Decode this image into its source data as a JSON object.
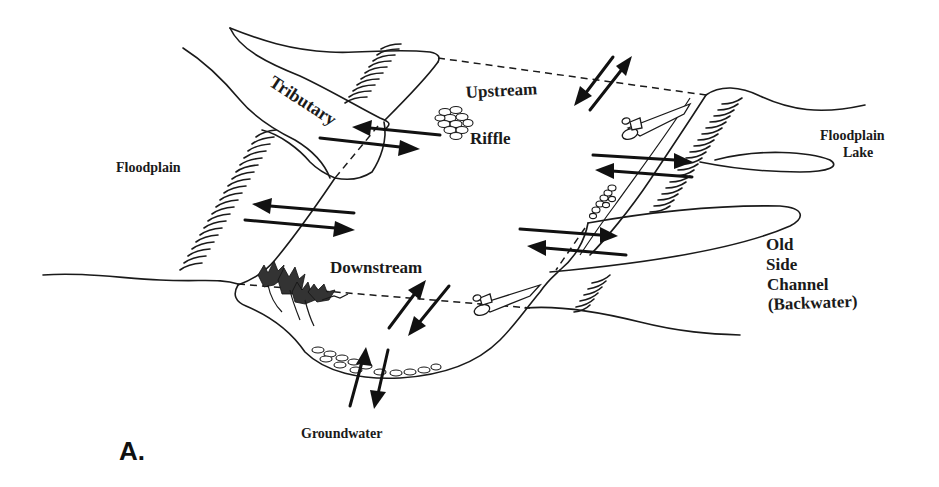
{
  "figure": {
    "panel_label": "A."
  },
  "labels": {
    "tributary": "Tributary",
    "upstream": "Upstream",
    "riffle": "Riffle",
    "floodplain": "Floodplain",
    "floodplain_lake_line1": "Floodplain",
    "floodplain_lake_line2": "Lake",
    "downstream": "Downstream",
    "old_side_channel_line1": "Old",
    "old_side_channel_line2": "Side",
    "old_side_channel_line3": "Channel",
    "old_side_channel_line4": "(Backwater)",
    "groundwater": "Groundwater"
  },
  "exchanges": [
    {
      "name": "tributary-main-channel",
      "direction": "bidirectional"
    },
    {
      "name": "floodplain-left-bank",
      "direction": "bidirectional"
    },
    {
      "name": "upstream-downstream-surface",
      "direction": "bidirectional"
    },
    {
      "name": "floodplain-lake",
      "direction": "bidirectional"
    },
    {
      "name": "side-channel-backwater",
      "direction": "bidirectional"
    },
    {
      "name": "downstream-longitudinal",
      "direction": "bidirectional"
    },
    {
      "name": "groundwater-vertical",
      "direction": "bidirectional"
    }
  ],
  "colors": {
    "ink": "#1a1a1a",
    "background": "#ffffff"
  }
}
